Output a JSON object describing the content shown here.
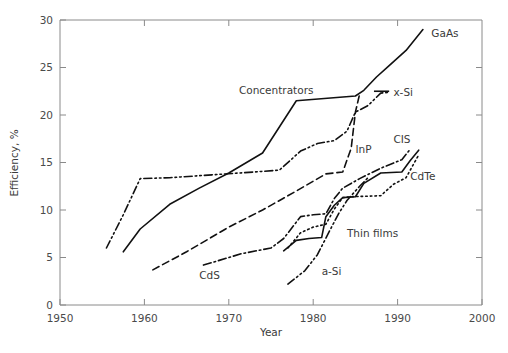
{
  "chart_data": {
    "type": "line",
    "title": "",
    "xlabel": "Year",
    "ylabel": "Efficiency, %",
    "xlim": [
      1950,
      2000
    ],
    "ylim": [
      0,
      30
    ],
    "xticks": [
      1950,
      1960,
      1970,
      1980,
      1990,
      2000
    ],
    "yticks": [
      0,
      5,
      10,
      15,
      20,
      25,
      30
    ],
    "xticklabels": [
      "1950",
      "1960",
      "1970",
      "1980",
      "1990",
      "2000"
    ],
    "yticklabels": [
      "0",
      "5",
      "10",
      "15",
      "20",
      "25",
      "30"
    ],
    "grid": false,
    "legend_position": "inline-annotations",
    "series": [
      {
        "name": "GaAs",
        "linestyle": "solid",
        "label": "GaAs",
        "label_x": 1994.0,
        "label_y": 28.6,
        "label_anchor": "start",
        "points": [
          [
            1957.5,
            5.6
          ],
          [
            1959.5,
            8.0
          ],
          [
            1963.0,
            10.6
          ],
          [
            1966.5,
            12.3
          ],
          [
            1970.0,
            13.9
          ],
          [
            1974.0,
            16.0
          ],
          [
            1978.0,
            21.5
          ],
          [
            1985.0,
            22.0
          ],
          [
            1986.0,
            22.6
          ],
          [
            1987.5,
            24.0
          ],
          [
            1989.0,
            25.2
          ],
          [
            1991.0,
            26.8
          ],
          [
            1993.0,
            29.0
          ]
        ]
      },
      {
        "name": "Concentrators",
        "linestyle": "solid-annotation",
        "label": "Concentrators",
        "label_x": 1971.2,
        "label_y": 22.6,
        "label_anchor": "start",
        "points": []
      },
      {
        "name": "x-Si",
        "linestyle": "dashdotdot",
        "label": "x-Si",
        "label_x": 1989.5,
        "label_y": 22.4,
        "label_anchor": "start",
        "points": [
          [
            1955.5,
            6.0
          ],
          [
            1957.5,
            9.5
          ],
          [
            1959.5,
            13.3
          ],
          [
            1963.0,
            13.4
          ],
          [
            1968.0,
            13.7
          ],
          [
            1973.0,
            14.0
          ],
          [
            1976.0,
            14.2
          ],
          [
            1978.5,
            16.2
          ],
          [
            1980.5,
            17.0
          ],
          [
            1982.5,
            17.3
          ],
          [
            1984.0,
            18.3
          ],
          [
            1985.0,
            20.3
          ],
          [
            1986.5,
            21.0
          ],
          [
            1988.0,
            22.3
          ],
          [
            1989.0,
            22.4
          ]
        ]
      },
      {
        "name": "InP",
        "linestyle": "dashed",
        "label": "InP",
        "label_x": 1985.0,
        "label_y": 16.4,
        "label_anchor": "start",
        "points": [
          [
            1961.0,
            3.7
          ],
          [
            1965.0,
            5.6
          ],
          [
            1970.0,
            8.2
          ],
          [
            1974.0,
            10.0
          ],
          [
            1978.0,
            12.0
          ],
          [
            1981.5,
            13.8
          ],
          [
            1983.5,
            14.0
          ],
          [
            1984.5,
            16.5
          ],
          [
            1985.0,
            20.3
          ],
          [
            1985.5,
            22.2
          ]
        ]
      },
      {
        "name": "CdS",
        "linestyle": "dashdot",
        "label": "CdS",
        "label_x": 1966.5,
        "label_y": 3.1,
        "label_anchor": "start",
        "points": [
          [
            1967.0,
            4.2
          ],
          [
            1971.5,
            5.4
          ],
          [
            1975.0,
            6.0
          ],
          [
            1976.5,
            7.0
          ],
          [
            1978.5,
            9.3
          ],
          [
            1980.0,
            9.5
          ],
          [
            1981.5,
            9.6
          ],
          [
            1982.5,
            11.2
          ],
          [
            1983.5,
            12.3
          ],
          [
            1985.5,
            13.3
          ],
          [
            1988.0,
            14.4
          ],
          [
            1990.5,
            15.3
          ],
          [
            1991.5,
            16.4
          ]
        ]
      },
      {
        "name": "CIS",
        "linestyle": "solid",
        "label": "CIS",
        "label_x": 1989.5,
        "label_y": 17.5,
        "label_anchor": "start",
        "points": [
          [
            1976.5,
            5.7
          ],
          [
            1978.0,
            6.8
          ],
          [
            1979.5,
            7.0
          ],
          [
            1981.0,
            7.1
          ],
          [
            1981.5,
            9.3
          ],
          [
            1982.5,
            10.5
          ],
          [
            1983.5,
            11.3
          ],
          [
            1985.0,
            11.4
          ],
          [
            1986.0,
            12.8
          ],
          [
            1988.0,
            13.9
          ],
          [
            1990.5,
            14.0
          ],
          [
            1991.5,
            15.2
          ],
          [
            1992.5,
            16.3
          ]
        ]
      },
      {
        "name": "CdTe",
        "linestyle": "dotted",
        "label": "CdTe",
        "label_x": 1991.5,
        "label_y": 13.6,
        "label_anchor": "start",
        "points": [
          [
            1977.0,
            6.0
          ],
          [
            1978.5,
            7.6
          ],
          [
            1980.0,
            8.2
          ],
          [
            1981.5,
            8.5
          ],
          [
            1982.5,
            10.1
          ],
          [
            1983.5,
            11.3
          ],
          [
            1984.5,
            11.4
          ],
          [
            1988.0,
            11.5
          ],
          [
            1989.5,
            12.7
          ],
          [
            1991.0,
            13.4
          ],
          [
            1992.5,
            15.8
          ]
        ]
      },
      {
        "name": "a-Si",
        "linestyle": "dashdotdot",
        "label": "a-Si",
        "label_x": 1981.0,
        "label_y": 3.6,
        "label_anchor": "start",
        "points": [
          [
            1977.0,
            2.2
          ],
          [
            1979.0,
            3.6
          ],
          [
            1980.5,
            5.3
          ],
          [
            1982.0,
            7.9
          ],
          [
            1983.0,
            9.6
          ],
          [
            1984.0,
            11.0
          ],
          [
            1985.5,
            12.5
          ],
          [
            1986.5,
            13.4
          ]
        ]
      },
      {
        "name": "Thin films",
        "linestyle": "none",
        "label": "Thin films",
        "label_x": 1984.0,
        "label_y": 7.6,
        "label_anchor": "start",
        "points": []
      }
    ],
    "annotations": [
      {
        "text": "Concentrators",
        "x": 1971.2,
        "y": 22.6
      },
      {
        "text": "GaAs",
        "x": 1994.0,
        "y": 28.6
      },
      {
        "text": "x-Si",
        "x": 1989.5,
        "y": 22.4
      },
      {
        "text": "InP",
        "x": 1985.0,
        "y": 16.4
      },
      {
        "text": "CIS",
        "x": 1989.5,
        "y": 17.5
      },
      {
        "text": "CdTe",
        "x": 1991.5,
        "y": 13.6
      },
      {
        "text": "CdS",
        "x": 1966.5,
        "y": 3.1
      },
      {
        "text": "a-Si",
        "x": 1981.0,
        "y": 3.6
      },
      {
        "text": "Thin films",
        "x": 1984.0,
        "y": 7.6
      }
    ],
    "extra_marks": [
      {
        "name": "x-si-leader-dash",
        "x1": 1987.2,
        "y1": 22.5,
        "x2": 1989.0,
        "y2": 22.5
      }
    ]
  }
}
